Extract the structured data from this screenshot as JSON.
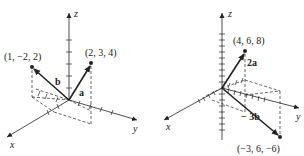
{
  "left": {
    "axes": {
      "x": "x",
      "y": "y",
      "z": "z"
    },
    "points": [
      {
        "label": "(1, −2, 2)",
        "coords": [
          1,
          -2,
          2
        ]
      },
      {
        "label": "(2, 3, 4)",
        "coords": [
          2,
          3,
          4
        ]
      }
    ],
    "vectors": [
      {
        "name": "b",
        "to": [
          1,
          -2,
          2
        ]
      },
      {
        "name": "a",
        "to": [
          2,
          3,
          4
        ]
      }
    ]
  },
  "right": {
    "axes": {
      "x": "x",
      "y": "y",
      "z": "z"
    },
    "points": [
      {
        "label": "(4, 6, 8)",
        "coords": [
          4,
          6,
          8
        ]
      },
      {
        "label": "(−3, 6, −6)",
        "coords": [
          -3,
          6,
          -6
        ]
      }
    ],
    "vectors": [
      {
        "name": "2a",
        "to": [
          4,
          6,
          8
        ]
      },
      {
        "name": "− 3b",
        "to": [
          -3,
          6,
          -6
        ]
      }
    ]
  },
  "colors": {
    "ink": "#222222",
    "background": "#ffffff"
  }
}
